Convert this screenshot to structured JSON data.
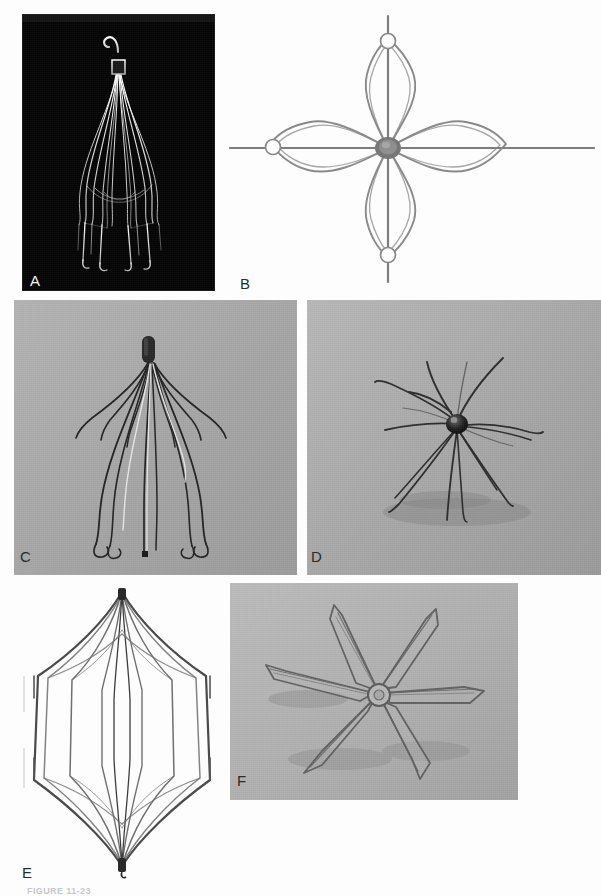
{
  "figure": {
    "caption": "FIGURE 11-23",
    "background_color": "#fdfdfd",
    "width": 601,
    "height": 896
  },
  "panels": [
    {
      "id": "A",
      "label": "A",
      "subject": "cone-shaped vena cava filter with retrieval hook",
      "background": "black photographic plate",
      "background_color": "#050505",
      "wire_color": "#e8e8e8",
      "label_color": "#f2f2f2",
      "rect": {
        "x": 22,
        "y": 14,
        "w": 193,
        "h": 277
      },
      "features": {
        "apex_hook": true,
        "collar_sleeve": true,
        "leg_count": 12,
        "hooked_feet": true,
        "orientation": "vertical, apex up"
      }
    },
    {
      "id": "B",
      "label": "B",
      "subject": "four-petal nitinol filter viewed end-on with radial spokes",
      "background": "white",
      "background_color": "#fdfdfd",
      "wire_color": "#8d8d8d",
      "label_color": "#2b2b2b",
      "rect": {
        "x": 222,
        "y": 10,
        "w": 379,
        "h": 285
      },
      "features": {
        "petal_count": 4,
        "spoke_count": 4,
        "eyelet_rings": 3,
        "central_hub": true,
        "orientation": "axial / end-on view"
      }
    },
    {
      "id": "C",
      "label": "C",
      "subject": "conical filter with splayed legs on gray backdrop",
      "background": "gray photographic backdrop",
      "background_color": "#a8a8a8",
      "wire_color": "#262626",
      "label_color": "#1f1f1f",
      "rect": {
        "x": 14,
        "y": 300,
        "w": 283,
        "h": 275
      },
      "features": {
        "apex_cap": true,
        "leg_count": 12,
        "hooked_feet": true,
        "orientation": "vertical, apex up"
      }
    },
    {
      "id": "D",
      "label": "D",
      "subject": "filter viewed obliquely showing radiating legs from hub",
      "background": "gray photographic backdrop",
      "background_color": "#a8a8a8",
      "wire_color": "#2c2c2c",
      "label_color": "#1f1f1f",
      "rect": {
        "x": 307,
        "y": 300,
        "w": 294,
        "h": 275
      },
      "features": {
        "central_hub": true,
        "leg_count": 12,
        "orientation": "oblique / near-axial view",
        "cast_shadow": true
      }
    },
    {
      "id": "E",
      "label": "E",
      "subject": "barrel / cage style filter with longitudinal struts",
      "background": "white",
      "background_color": "#fdfdfd",
      "wire_color": "#6b6b6b",
      "label_color": "#2b2b2b",
      "rect": {
        "x": 10,
        "y": 580,
        "w": 225,
        "h": 300
      },
      "features": {
        "shape": "elongated hexagonal cage",
        "strut_count": 8,
        "apex_crimps": 2,
        "orientation": "vertical"
      }
    },
    {
      "id": "F",
      "label": "F",
      "subject": "six-petal star filter photographed at an angle",
      "background": "gray photographic backdrop",
      "background_color": "#b0b0b0",
      "wire_color": "#6e6e6e",
      "label_color": "#1f1f1f",
      "rect": {
        "x": 230,
        "y": 583,
        "w": 288,
        "h": 217
      },
      "features": {
        "petal_count": 6,
        "central_ring": true,
        "orientation": "oblique perspective",
        "cast_shadow": true
      }
    }
  ]
}
